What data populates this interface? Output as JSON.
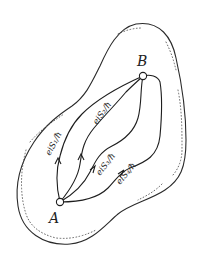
{
  "diagram": {
    "title": "",
    "points": {
      "start": {
        "label": "A"
      },
      "end": {
        "label": "B"
      }
    },
    "paths": [
      {
        "id": "S1",
        "label": "e^{iS₁/ħ}",
        "text": "eiS₁/ħ"
      },
      {
        "id": "S2",
        "label": "e^{iS₂/ħ}",
        "text": "eiS₂/ħ"
      },
      {
        "id": "S3",
        "label": "e^{iS₃/ħ}",
        "text": "eiS₃/ħ"
      },
      {
        "id": "S4",
        "label": "e^{iS₄/ħ}",
        "text": "eiS₄/ħ"
      }
    ],
    "region": "closed region bounded by outline with stippled inner edge",
    "colors": {
      "ink": "#1e1e1e",
      "background": "#ffffff"
    }
  }
}
